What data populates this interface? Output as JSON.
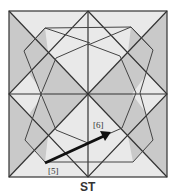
{
  "diagram": {
    "caption": "ST",
    "labels": {
      "start": "[5]",
      "end": "[6]"
    },
    "colors": {
      "background": "#ffffff",
      "light_fill": "#e9e9e9",
      "shaded_fill": "#c9c9c9",
      "line": "#333333",
      "arrow": "#111111"
    },
    "square": {
      "x": 9,
      "y": 11,
      "size_w": 158,
      "size_h": 166
    },
    "arrow": {
      "from": [
        45,
        163
      ],
      "to": [
        110,
        133
      ]
    }
  }
}
